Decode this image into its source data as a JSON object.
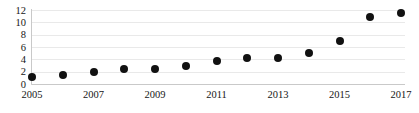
{
  "chart_data": {
    "type": "scatter",
    "title": "",
    "subtitle": "",
    "xlabel": "",
    "ylabel": "",
    "x": [
      2005,
      2006,
      2007,
      2008,
      2009,
      2010,
      2011,
      2012,
      2013,
      2014,
      2015,
      2016,
      2017
    ],
    "values": [
      1.1,
      1.5,
      1.9,
      2.5,
      2.5,
      2.9,
      3.7,
      4.2,
      4.2,
      5.0,
      6.9,
      10.9,
      11.5
    ],
    "series": [
      {
        "name": "",
        "values": [
          1.1,
          1.5,
          1.9,
          2.5,
          2.5,
          2.9,
          3.7,
          4.2,
          4.2,
          5.0,
          6.9,
          10.9,
          11.5
        ]
      }
    ],
    "xlim": [
      2005,
      2017
    ],
    "ylim": [
      0,
      12
    ],
    "yticks": [
      0,
      2,
      4,
      6,
      8,
      10,
      12
    ],
    "ytick_labels": [
      "0",
      "2",
      "4",
      "6",
      "8",
      "10",
      "12"
    ],
    "xticks": [
      2005,
      2007,
      2009,
      2011,
      2013,
      2015,
      2017
    ],
    "xtick_labels": [
      "2005",
      "2007",
      "2009",
      "2011",
      "2013",
      "2015",
      "2017"
    ],
    "grid": true,
    "grid_axis": "y",
    "legend": false,
    "legend_position": "none",
    "marker": "circle",
    "marker_color": "#111111",
    "grid_color": "#e9e9e9",
    "axis_color": "#c9c9c9",
    "background_color": "#ffffff",
    "annotations": []
  }
}
